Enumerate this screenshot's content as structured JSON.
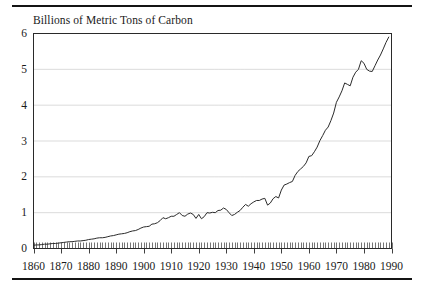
{
  "chart_data": {
    "type": "line",
    "title": "Billions of Metric Tons of Carbon",
    "xlabel": "",
    "ylabel": "",
    "xlim": [
      1860,
      1990
    ],
    "ylim": [
      0,
      6
    ],
    "grid": true,
    "legend": false,
    "y_ticks": [
      "0",
      "1",
      "2",
      "3",
      "4",
      "5",
      "6"
    ],
    "y_tick_values": [
      0,
      1,
      2,
      3,
      4,
      5,
      6
    ],
    "x_ticks": [
      "1860",
      "1870",
      "1880",
      "1890",
      "1900",
      "1910",
      "1920",
      "1930",
      "1940",
      "1950",
      "1960",
      "1970",
      "1980",
      "1990"
    ],
    "x_tick_values": [
      1860,
      1870,
      1880,
      1890,
      1900,
      1910,
      1920,
      1930,
      1940,
      1950,
      1960,
      1970,
      1980,
      1990
    ],
    "minor_x_ticks_every": 1,
    "series": [
      {
        "name": "Global carbon emissions from fossil fuels",
        "x": [
          1860,
          1861,
          1862,
          1863,
          1864,
          1865,
          1866,
          1867,
          1868,
          1869,
          1870,
          1871,
          1872,
          1873,
          1874,
          1875,
          1876,
          1877,
          1878,
          1879,
          1880,
          1881,
          1882,
          1883,
          1884,
          1885,
          1886,
          1887,
          1888,
          1889,
          1890,
          1891,
          1892,
          1893,
          1894,
          1895,
          1896,
          1897,
          1898,
          1899,
          1900,
          1901,
          1902,
          1903,
          1904,
          1905,
          1906,
          1907,
          1908,
          1909,
          1910,
          1911,
          1912,
          1913,
          1914,
          1915,
          1916,
          1917,
          1918,
          1919,
          1920,
          1921,
          1922,
          1923,
          1924,
          1925,
          1926,
          1927,
          1928,
          1929,
          1930,
          1931,
          1932,
          1933,
          1934,
          1935,
          1936,
          1937,
          1938,
          1939,
          1940,
          1941,
          1942,
          1943,
          1944,
          1945,
          1946,
          1947,
          1948,
          1949,
          1950,
          1951,
          1952,
          1953,
          1954,
          1955,
          1956,
          1957,
          1958,
          1959,
          1960,
          1961,
          1962,
          1963,
          1964,
          1965,
          1966,
          1967,
          1968,
          1969,
          1970,
          1971,
          1972,
          1973,
          1974,
          1975,
          1976,
          1977,
          1978,
          1979,
          1980,
          1981,
          1982,
          1983,
          1984,
          1985,
          1986,
          1987,
          1988,
          1989
        ],
        "y": [
          0.09,
          0.1,
          0.1,
          0.11,
          0.12,
          0.12,
          0.13,
          0.14,
          0.14,
          0.15,
          0.16,
          0.17,
          0.18,
          0.19,
          0.19,
          0.2,
          0.21,
          0.21,
          0.22,
          0.23,
          0.25,
          0.26,
          0.27,
          0.29,
          0.3,
          0.3,
          0.31,
          0.33,
          0.35,
          0.36,
          0.38,
          0.4,
          0.41,
          0.42,
          0.44,
          0.47,
          0.49,
          0.5,
          0.53,
          0.57,
          0.6,
          0.61,
          0.62,
          0.68,
          0.69,
          0.72,
          0.78,
          0.86,
          0.83,
          0.86,
          0.9,
          0.9,
          0.95,
          1.0,
          0.92,
          0.9,
          0.96,
          0.99,
          0.95,
          0.84,
          0.95,
          0.83,
          0.89,
          1.0,
          0.99,
          1.01,
          1.0,
          1.06,
          1.07,
          1.13,
          1.09,
          1.0,
          0.92,
          0.95,
          1.01,
          1.06,
          1.15,
          1.23,
          1.18,
          1.25,
          1.3,
          1.34,
          1.34,
          1.38,
          1.4,
          1.21,
          1.27,
          1.39,
          1.45,
          1.41,
          1.63,
          1.77,
          1.8,
          1.84,
          1.87,
          2.04,
          2.15,
          2.22,
          2.29,
          2.39,
          2.57,
          2.59,
          2.7,
          2.83,
          3.01,
          3.15,
          3.3,
          3.39,
          3.57,
          3.78,
          4.08,
          4.23,
          4.4,
          4.62,
          4.58,
          4.54,
          4.78,
          4.92,
          5.0,
          5.24,
          5.17,
          5.0,
          4.95,
          4.94,
          5.1,
          5.26,
          5.4,
          5.57,
          5.75,
          5.9
        ]
      }
    ]
  },
  "axes": {
    "y_axis_name": "y-axis",
    "x_axis_name": "x-axis"
  }
}
